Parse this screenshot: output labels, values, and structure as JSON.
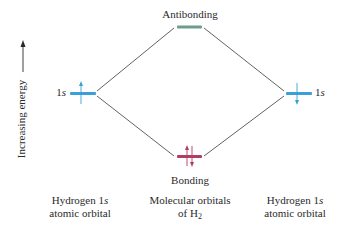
{
  "diagram": {
    "y_axis": {
      "label": "Increasing energy",
      "arrow": "up"
    },
    "levels": {
      "antibonding": {
        "label": "Antibonding",
        "color": "#6f9b8c",
        "electrons": []
      },
      "bonding": {
        "label": "Bonding",
        "color": "#b23c66",
        "electrons": [
          "up",
          "down"
        ]
      },
      "left_atomic": {
        "label_prefix": "1",
        "label_orbital": "s",
        "color": "#3b9fd8",
        "electrons": [
          "up"
        ]
      },
      "right_atomic": {
        "label_prefix": "1",
        "label_orbital": "s",
        "color": "#3b9fd8",
        "electrons": [
          "down"
        ]
      }
    },
    "columns": {
      "left": {
        "line1_prefix": "Hydrogen 1",
        "line1_orbital": "s",
        "line2": "atomic orbital"
      },
      "center": {
        "line1": "Molecular orbitals",
        "line2_prefix": "of H",
        "line2_sub": "2"
      },
      "right": {
        "line1_prefix": "Hydrogen 1",
        "line1_orbital": "s",
        "line2": "atomic orbital"
      }
    },
    "connector_color": "#3a3a3a"
  }
}
